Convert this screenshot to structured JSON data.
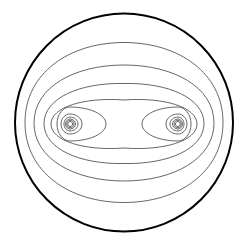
{
  "figure": {
    "type": "contour-diagram",
    "colors": {
      "background": "#ffffff",
      "boundary": "#000000",
      "contour": "#555555"
    },
    "boundary": {
      "cx": 124,
      "cy": 122.5,
      "r": 109,
      "stroke_width": 2
    },
    "charges": [
      {
        "name": "left-charge",
        "cx": 70,
        "cy": 124
      },
      {
        "name": "right-charge",
        "cx": 178,
        "cy": 124
      }
    ],
    "outer_contours": [
      {
        "rx": 99,
        "ry": 80,
        "cy": 122.5
      },
      {
        "rx": 90,
        "ry": 58,
        "cy": 123
      },
      {
        "rx": 80,
        "ry": 41,
        "cy": 123.5
      },
      {
        "rx": 73,
        "ry": 27,
        "cy": 124
      }
    ],
    "inner_loops": {
      "left": [
        {
          "rx_out": 36,
          "rx_in": 13,
          "ry": 17
        },
        {
          "rx_out": 12,
          "rx_in": 9,
          "ry": 10
        },
        {
          "rx_out": 8,
          "rx_in": 6,
          "ry": 7
        },
        {
          "rx_out": 5.5,
          "rx_in": 4.5,
          "ry": 5
        },
        {
          "rx_out": 4,
          "rx_in": 3.2,
          "ry": 3.7
        },
        {
          "rx_out": 2.6,
          "rx_in": 2.2,
          "ry": 2.5
        }
      ],
      "right": [
        {
          "rx_out": 36,
          "rx_in": 13,
          "ry": 17
        },
        {
          "rx_out": 12,
          "rx_in": 9,
          "ry": 10
        },
        {
          "rx_out": 8,
          "rx_in": 6,
          "ry": 7
        },
        {
          "rx_out": 5.5,
          "rx_in": 4.5,
          "ry": 5
        },
        {
          "rx_out": 4,
          "rx_in": 3.2,
          "ry": 3.7
        },
        {
          "rx_out": 2.6,
          "rx_in": 2.2,
          "ry": 2.5
        }
      ]
    }
  }
}
